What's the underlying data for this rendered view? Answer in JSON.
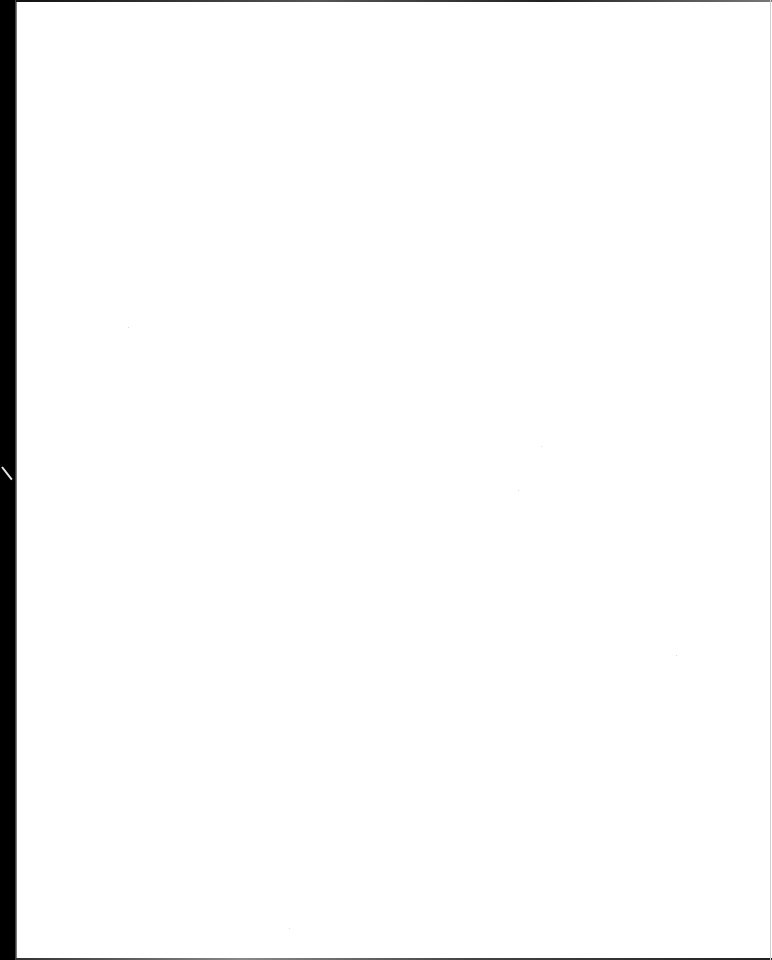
{
  "document": {
    "type": "scanned-page",
    "content": "",
    "is_blank": true
  },
  "colors": {
    "page_background": "#ffffff",
    "scan_border": "#000000"
  }
}
